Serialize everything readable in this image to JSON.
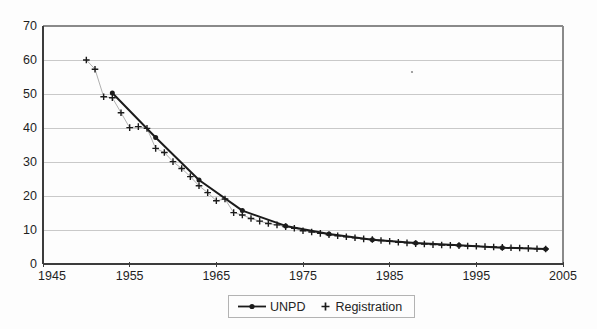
{
  "page": {
    "background": "#fdfdfd"
  },
  "chart_data": {
    "type": "line",
    "title": "",
    "xlabel": "",
    "ylabel": "",
    "x_axis": {
      "min": 1945,
      "max": 2005,
      "tick_step": 10,
      "ticks": [
        1945,
        1955,
        1965,
        1975,
        1985,
        1995,
        2005
      ]
    },
    "y_axis": {
      "min": 0,
      "max": 70,
      "tick_step": 10,
      "ticks": [
        0,
        10,
        20,
        30,
        40,
        50,
        60,
        70
      ]
    },
    "grid": "horizontal-light",
    "legend": {
      "position": "bottom-center",
      "items": [
        "UNPD",
        "Registration"
      ]
    },
    "colors": {
      "series": "#1b1b1b",
      "grid": "#c9c9c9",
      "frame": "#8a8a8a",
      "axis": "#3c3c3c",
      "label": "#1f1f1f",
      "registration_connector": "#9b9b9b"
    },
    "series": [
      {
        "name": "UNPD",
        "marker": "filled-circle",
        "line_style": "solid-thick",
        "x": [
          1953,
          1958,
          1963,
          1968,
          1973,
          1978,
          1983,
          1988,
          1993,
          1998,
          2003
        ],
        "y": [
          50.3,
          37.2,
          24.7,
          15.7,
          11.2,
          8.8,
          7.1,
          6.2,
          5.5,
          4.8,
          4.4
        ]
      },
      {
        "name": "Registration",
        "marker": "plus",
        "line_style": "thin-solid",
        "x": [
          1950,
          1951,
          1952,
          1953,
          1954,
          1955,
          1956,
          1957,
          1958,
          1959,
          1960,
          1961,
          1962,
          1963,
          1964,
          1965,
          1966,
          1967,
          1968,
          1969,
          1970,
          1971,
          1972,
          1973,
          1974,
          1975,
          1976,
          1977,
          1978,
          1979,
          1980,
          1981,
          1982,
          1983,
          1984,
          1985,
          1986,
          1987,
          1988,
          1989,
          1990,
          1991,
          1992,
          1993,
          1994,
          1995,
          1996,
          1997,
          1998,
          1999,
          2000,
          2001,
          2002,
          2003
        ],
        "y": [
          60.0,
          57.3,
          49.2,
          48.9,
          44.5,
          40.1,
          40.4,
          39.9,
          34.0,
          32.8,
          30.1,
          28.1,
          25.7,
          23.0,
          21.0,
          18.6,
          19.1,
          15.1,
          14.4,
          13.4,
          12.6,
          11.9,
          11.5,
          11.0,
          10.5,
          9.8,
          9.4,
          9.0,
          8.6,
          8.3,
          8.0,
          7.7,
          7.4,
          7.2,
          6.9,
          6.7,
          6.4,
          6.2,
          6.0,
          5.9,
          5.7,
          5.6,
          5.5,
          5.4,
          5.3,
          5.2,
          5.1,
          5.0,
          4.9,
          4.8,
          4.7,
          4.6,
          4.5,
          4.4
        ]
      }
    ],
    "artifacts": {
      "speck": {
        "x": 412,
        "y": 72
      }
    }
  }
}
